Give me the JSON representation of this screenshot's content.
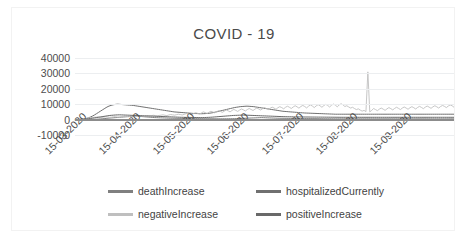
{
  "chart": {
    "title": "COVID - 19",
    "frame_border_color": "#f2f2f2",
    "gridline_color": "#eceef0",
    "axis_color": "#8c8c8c"
  },
  "legend": {
    "items": [
      {
        "label": "deathIncrease",
        "color": "#808080"
      },
      {
        "label": "hospitalizedCurrently",
        "color": "#707070"
      },
      {
        "label": "negativeIncrease",
        "color": "#bfbfbf"
      },
      {
        "label": "positiveIncrease",
        "color": "#696969"
      }
    ]
  },
  "chart_data": {
    "type": "line",
    "title": "COVID - 19",
    "xlabel": "",
    "ylabel": "",
    "ylim": [
      -10000,
      40000
    ],
    "ytick_labels": [
      "40000",
      "30000",
      "20000",
      "10000",
      "0",
      "-10000"
    ],
    "ytick_values": [
      40000,
      30000,
      20000,
      10000,
      0,
      -10000
    ],
    "xtick_labels": [
      "15-03-2020",
      "15-04-2020",
      "15-05-2020",
      "15-06-2020",
      "15-07-2020",
      "15-08-2020",
      "15-09-2020"
    ],
    "grid": true,
    "legend_position": "bottom",
    "x_start": "15-03-2020",
    "x_end": "30-09-2020",
    "series": [
      {
        "name": "deathIncrease",
        "color": "#808080",
        "values": [
          10,
          20,
          25,
          30,
          40,
          55,
          70,
          90,
          110,
          150,
          200,
          260,
          330,
          420,
          520,
          640,
          780,
          900,
          1000,
          1100,
          1200,
          1300,
          1400,
          1500,
          1600,
          1700,
          1800,
          1900,
          2000,
          2100,
          2200,
          2300,
          2200,
          2100,
          2000,
          1900,
          1800,
          1700,
          1600,
          1500,
          1400,
          1300,
          1250,
          1200,
          1150,
          1100,
          1050,
          1000,
          950,
          900,
          880,
          860,
          840,
          820,
          800,
          780,
          760,
          740,
          720,
          700,
          680,
          660,
          640,
          620,
          600,
          590,
          580,
          570,
          560,
          550,
          540,
          530,
          520,
          510,
          500,
          510,
          520,
          530,
          540,
          560,
          580,
          600,
          620,
          650,
          700,
          750,
          800,
          850,
          900,
          950,
          1000,
          1050,
          1100,
          1150,
          1200,
          1250,
          1300,
          1250,
          1200,
          1150,
          1100,
          1050,
          1000,
          950,
          900,
          880,
          860,
          840,
          820,
          800,
          780,
          760,
          740,
          720,
          700,
          690,
          680,
          670,
          660,
          650,
          640,
          630,
          620,
          610,
          600,
          590,
          580,
          570,
          560,
          550,
          540,
          530,
          520,
          510,
          500,
          500,
          500,
          500,
          500,
          500,
          500,
          500,
          500,
          500,
          500,
          500,
          500,
          500,
          500,
          500,
          500,
          500,
          500,
          500,
          500,
          500,
          500,
          500,
          500,
          500,
          500,
          500,
          500,
          500,
          500,
          500,
          500,
          500,
          500,
          500,
          500,
          500,
          500,
          500,
          500,
          500,
          500,
          500,
          500,
          500,
          500,
          500,
          500,
          500,
          500,
          500,
          500,
          500,
          500,
          500,
          500,
          500,
          500,
          500,
          500,
          500
        ]
      },
      {
        "name": "hospitalizedCurrently",
        "color": "#707070",
        "values": [
          50,
          80,
          120,
          200,
          320,
          500,
          800,
          1200,
          1700,
          2300,
          3000,
          3800,
          4600,
          5400,
          6200,
          7000,
          7800,
          8500,
          9000,
          9400,
          9700,
          9900,
          10000,
          9900,
          9800,
          9700,
          9600,
          9500,
          9400,
          9300,
          9200,
          9000,
          8800,
          8600,
          8400,
          8200,
          8000,
          7800,
          7600,
          7400,
          7200,
          7000,
          6800,
          6600,
          6400,
          6200,
          6000,
          5800,
          5600,
          5400,
          5200,
          5000,
          4900,
          4800,
          4700,
          4600,
          4500,
          4400,
          4300,
          4200,
          4100,
          4000,
          3950,
          3900,
          3850,
          3800,
          3850,
          3900,
          4000,
          4100,
          4300,
          4500,
          4800,
          5100,
          5400,
          5700,
          6000,
          6300,
          6600,
          6900,
          7200,
          7500,
          7800,
          8000,
          8200,
          8400,
          8500,
          8600,
          8700,
          8700,
          8600,
          8500,
          8400,
          8200,
          8000,
          7800,
          7600,
          7400,
          7200,
          7000,
          6800,
          6600,
          6400,
          6200,
          6000,
          5800,
          5600,
          5400,
          5300,
          5200,
          5100,
          5000,
          4900,
          4800,
          4700,
          4600,
          4500,
          4400,
          4300,
          4250,
          4200,
          4150,
          4100,
          4050,
          4000,
          3950,
          3900,
          3850,
          3800,
          3750,
          3700,
          3650,
          3600,
          3550,
          3500,
          3500,
          3500,
          3500,
          3500,
          3500,
          3500,
          3500,
          3500,
          3500,
          3500,
          3500,
          3500,
          3500,
          3500,
          3500,
          3500,
          3500,
          3500,
          3500,
          3500,
          3500,
          3500,
          3500,
          3500,
          3500,
          3500,
          3500,
          3500,
          3500,
          3500,
          3500,
          3500,
          3500,
          3500,
          3500,
          3500,
          3500,
          3500,
          3500,
          3500,
          3500,
          3500,
          3500,
          3500,
          3500,
          3500,
          3500,
          3500,
          3500,
          3500,
          3500,
          3500,
          3500,
          3500,
          3500,
          3500,
          3500,
          3500,
          3500,
          3500,
          3500
        ]
      },
      {
        "name": "negativeIncrease",
        "color": "#bfbfbf",
        "note": "Main oscillating light-grey series; rises from near 0 in March to ~5000-10000 through summer, with a single sharp spike to ~31000 in late August",
        "spike": {
          "x_label": "late 08-2020",
          "value": 31000
        },
        "values": [
          100,
          150,
          200,
          300,
          450,
          600,
          800,
          1000,
          1200,
          1400,
          1500,
          1600,
          1700,
          1500,
          1400,
          1600,
          1800,
          1700,
          1500,
          1600,
          1800,
          1900,
          1700,
          1600,
          1800,
          2000,
          2200,
          2000,
          1900,
          2100,
          2300,
          2200,
          2000,
          2200,
          2400,
          2300,
          2100,
          2300,
          2500,
          2400,
          2600,
          2800,
          2600,
          2400,
          2700,
          2900,
          3100,
          2800,
          2600,
          3000,
          3300,
          3100,
          2900,
          3200,
          3500,
          3300,
          3000,
          3400,
          3800,
          4200,
          3700,
          3300,
          3900,
          4500,
          4100,
          3600,
          4300,
          5000,
          4600,
          4000,
          4800,
          5400,
          5000,
          4400,
          5100,
          5800,
          5300,
          4700,
          5500,
          6200,
          5700,
          5000,
          5900,
          6600,
          6000,
          5300,
          6200,
          6900,
          6300,
          5600,
          6500,
          7200,
          6600,
          5900,
          6800,
          7500,
          6900,
          6200,
          7100,
          7800,
          7200,
          6500,
          7400,
          8100,
          7500,
          6700,
          7700,
          8400,
          7800,
          7000,
          8000,
          8700,
          8000,
          7200,
          8200,
          9000,
          8300,
          7400,
          8500,
          9200,
          8500,
          7600,
          8700,
          9500,
          8800,
          7800,
          8900,
          9700,
          9000,
          8000,
          9100,
          9900,
          9200,
          8200,
          9300,
          10100,
          9400,
          8300,
          9500,
          10300,
          9600,
          8500,
          9000,
          8200,
          7500,
          8000,
          7200,
          6500,
          7000,
          6200,
          5500,
          6000,
          5200,
          31000,
          5000,
          6000,
          7200,
          6500,
          5800,
          6800,
          7500,
          6800,
          6000,
          7000,
          7800,
          7100,
          6300,
          7300,
          8000,
          7300,
          6500,
          7500,
          8200,
          7500,
          6700,
          7700,
          8400,
          7700,
          6900,
          7900,
          8600,
          7900,
          7100,
          8100,
          8800,
          8100,
          7300,
          8300,
          9000,
          8300,
          7500,
          8500,
          9200,
          8600,
          7800,
          8800,
          9500,
          9000,
          8000
        ]
      },
      {
        "name": "positiveIncrease",
        "color": "#696969",
        "values": [
          20,
          40,
          70,
          120,
          200,
          300,
          420,
          560,
          720,
          900,
          1100,
          1300,
          1500,
          1700,
          1900,
          2100,
          2300,
          2500,
          2700,
          2800,
          2900,
          3000,
          3050,
          3100,
          3050,
          3000,
          2950,
          2900,
          2850,
          2800,
          2750,
          2700,
          2650,
          2600,
          2550,
          2500,
          2450,
          2400,
          2350,
          2300,
          2250,
          2200,
          2150,
          2100,
          2050,
          2000,
          1950,
          1900,
          1850,
          1800,
          1750,
          1700,
          1650,
          1600,
          1550,
          1500,
          1480,
          1460,
          1440,
          1420,
          1400,
          1380,
          1360,
          1340,
          1320,
          1300,
          1320,
          1350,
          1400,
          1450,
          1520,
          1600,
          1700,
          1800,
          1900,
          2000,
          2100,
          2200,
          2300,
          2400,
          2500,
          2600,
          2700,
          2750,
          2800,
          2850,
          2900,
          2900,
          2880,
          2850,
          2800,
          2750,
          2700,
          2650,
          2600,
          2550,
          2500,
          2450,
          2400,
          2350,
          2300,
          2250,
          2200,
          2150,
          2100,
          2050,
          2000,
          1950,
          1900,
          1880,
          1860,
          1840,
          1820,
          1800,
          1780,
          1760,
          1740,
          1720,
          1700,
          1690,
          1680,
          1670,
          1660,
          1650,
          1640,
          1630,
          1620,
          1610,
          1600,
          1590,
          1580,
          1570,
          1560,
          1550,
          1540,
          1530,
          1520,
          1510,
          1500,
          1500,
          1500,
          1500,
          1500,
          1500,
          1500,
          1500,
          1500,
          1500,
          1500,
          1500,
          1500,
          1500,
          1500,
          1500,
          1500,
          1500,
          1500,
          1500,
          1500,
          1500,
          1500,
          1500,
          1500,
          1500,
          1500,
          1500,
          1500,
          1500,
          1500,
          1500,
          1500,
          1500,
          1500,
          1500,
          1500,
          1500,
          1500,
          1500,
          1500,
          1500,
          1500,
          1500,
          1500,
          1500,
          1500,
          1500,
          1500,
          1500,
          1500,
          1500,
          1500,
          1500,
          1500,
          1500,
          1500,
          1500,
          1500
        ]
      }
    ]
  }
}
